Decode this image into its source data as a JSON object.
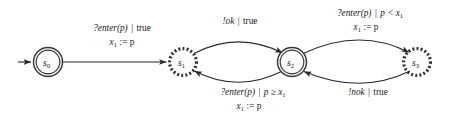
{
  "figure": {
    "kind": "register-automaton-state-diagram",
    "background_color": "#ffffff",
    "stroke_color": "#2b2b2b",
    "node_fill_color": "#fbfbfb"
  },
  "states": [
    {
      "id": "s0",
      "name": "s",
      "subscript": "0",
      "shape": "double-circle-solid",
      "cx": 48,
      "cy": 62,
      "r": 14.5,
      "initial": true
    },
    {
      "id": "s1",
      "name": "s",
      "subscript": "1",
      "shape": "dashed-sunburst-circle",
      "cx": 183,
      "cy": 62,
      "r": 14.0,
      "initial": false
    },
    {
      "id": "s2",
      "name": "s",
      "subscript": "2",
      "shape": "double-circle-solid",
      "cx": 292,
      "cy": 62,
      "r": 14.5,
      "initial": false
    },
    {
      "id": "s3",
      "name": "s",
      "subscript": "3",
      "shape": "dashed-sunburst-circle",
      "cx": 417,
      "cy": 62,
      "r": 14.0,
      "initial": false
    }
  ],
  "initial_arrow": {
    "from_x": 18,
    "to_x": 33,
    "y": 62
  },
  "transitions": [
    {
      "id": "t0",
      "from": "s0",
      "to": "s1",
      "style": "straight",
      "label_guard_action": "?enter(p)",
      "label_separator": "|",
      "label_guard": "true",
      "label_update_var": "x",
      "label_update_sub": "1",
      "label_update_op": ":= p",
      "label_line1": "?enter(p) | true",
      "label_line2": "x₁ := p",
      "label_x": 122,
      "label_y1": 31,
      "label_y2": 45
    },
    {
      "id": "t1",
      "from": "s1",
      "to": "s2",
      "style": "curve-upper",
      "label_guard_action": "!ok",
      "label_separator": "|",
      "label_guard": "true",
      "label_update_var": "",
      "label_update_sub": "",
      "label_update_op": "",
      "label_line1": "!ok | true",
      "label_line2": "",
      "label_x": 240,
      "label_y1": 24,
      "label_y2": 0
    },
    {
      "id": "t2",
      "from": "s2",
      "to": "s1",
      "style": "curve-lower",
      "label_guard_action": "?enter(p)",
      "label_separator": "|",
      "label_guard": "p ≥ x₁",
      "label_update_var": "x",
      "label_update_sub": "1",
      "label_update_op": ":= p",
      "label_line1": "?enter(p) | p ≥ x₁",
      "label_line2": "x₁ := p",
      "label_x": 253,
      "label_y1": 95,
      "label_y2": 109
    },
    {
      "id": "t3",
      "from": "s2",
      "to": "s3",
      "style": "curve-upper",
      "label_guard_action": "?enter(p)",
      "label_separator": "|",
      "label_guard": "p < x₁",
      "label_update_var": "x",
      "label_update_sub": "1",
      "label_update_op": ":= p",
      "label_line1": "?enter(p) | p < x₁",
      "label_line2": "x₁ := p",
      "label_x": 370,
      "label_y1": 16,
      "label_y2": 30
    },
    {
      "id": "t4",
      "from": "s3",
      "to": "s2",
      "style": "curve-lower",
      "label_guard_action": "!nok",
      "label_separator": "|",
      "label_guard": "true",
      "label_update_var": "",
      "label_update_sub": "",
      "label_update_op": "",
      "label_line1": "!nok | true",
      "label_line2": "",
      "label_x": 368,
      "label_y1": 95,
      "label_y2": 0
    }
  ],
  "label_parts": {
    "enter_action": "?enter(p)",
    "pipe": "|",
    "true_word": "true",
    "ok_action": "!ok",
    "nok_action": "!nok",
    "guard_ge": "p ≥ x",
    "guard_lt": "p < x",
    "update_var": "x",
    "update_assign": ":= p",
    "sub_one": "1"
  }
}
